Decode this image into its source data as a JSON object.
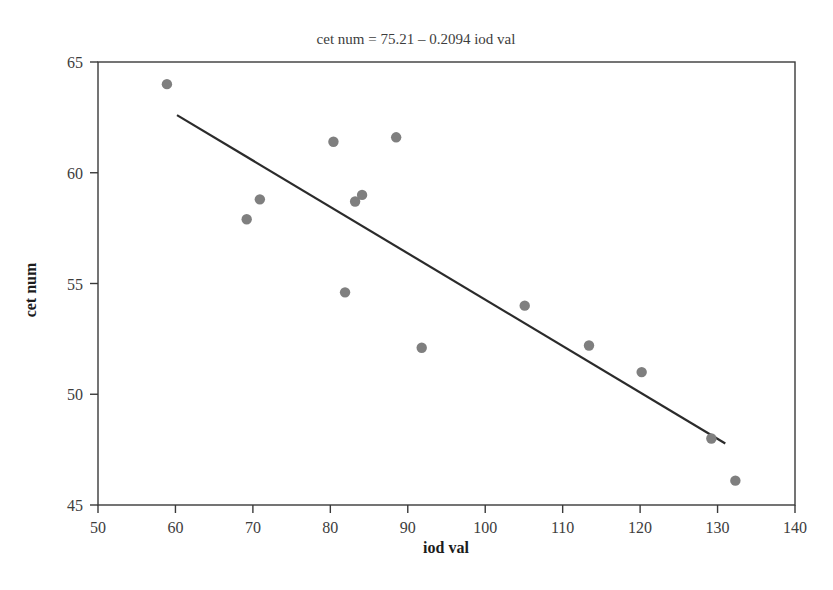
{
  "chart_data": {
    "type": "scatter",
    "title": "cet num = 75.21 – 0.2094 iod val",
    "xlabel": "iod val",
    "ylabel": "cet num",
    "xlim": [
      50,
      140
    ],
    "ylim": [
      45,
      65
    ],
    "xticks": [
      50,
      60,
      70,
      80,
      90,
      100,
      110,
      120,
      130,
      140
    ],
    "yticks": [
      45,
      50,
      55,
      60,
      65
    ],
    "grid": false,
    "legend": null,
    "marker_color": "#7f7f7f",
    "line_color": "#2b2b2b",
    "x": [
      58.9,
      69.2,
      70.9,
      80.4,
      81.9,
      83.2,
      84.1,
      88.5,
      91.8,
      105.1,
      113.4,
      120.2,
      129.2,
      132.3
    ],
    "y": [
      64.0,
      57.9,
      58.8,
      61.4,
      54.6,
      58.7,
      59.0,
      61.6,
      52.1,
      54.0,
      52.2,
      51.0,
      48.0,
      46.1
    ],
    "points": [
      {
        "x": 58.9,
        "y": 64.0
      },
      {
        "x": 69.2,
        "y": 57.9
      },
      {
        "x": 70.9,
        "y": 58.8
      },
      {
        "x": 80.4,
        "y": 61.4
      },
      {
        "x": 81.9,
        "y": 54.6
      },
      {
        "x": 83.2,
        "y": 58.7
      },
      {
        "x": 84.1,
        "y": 59.0
      },
      {
        "x": 88.5,
        "y": 61.6
      },
      {
        "x": 91.8,
        "y": 52.1
      },
      {
        "x": 105.1,
        "y": 54.0
      },
      {
        "x": 113.4,
        "y": 52.2
      },
      {
        "x": 120.2,
        "y": 51.0
      },
      {
        "x": 129.2,
        "y": 48.0
      },
      {
        "x": 132.3,
        "y": 46.1
      }
    ],
    "fit": {
      "intercept": 75.21,
      "slope": -0.2094,
      "equation": "cet num = 75.21 – 0.2094 iod val",
      "x_start": 60.2,
      "x_end": 131.0
    }
  }
}
